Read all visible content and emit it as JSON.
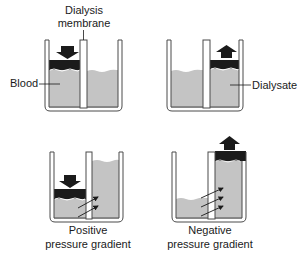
{
  "diagram": {
    "type": "dialysis-pressure-gradient-illustration",
    "colors": {
      "fluid": "#c4c4c4",
      "piston": "#1b1b1b",
      "outline": "#4a4a4a",
      "arrow": "#1b1b1b",
      "text": "#1a1a1a",
      "background": "#ffffff"
    },
    "labels": {
      "membrane_line1": "Dialysis",
      "membrane_line2": "membrane",
      "blood": "Blood",
      "dialysate": "Dialysate",
      "positive_line1": "Positive",
      "positive_line2": "pressure gradient",
      "negative_line1": "Negative",
      "negative_line2": "pressure gradient"
    },
    "panels": [
      {
        "id": "top-left",
        "piston_side": "left",
        "piston_direction": "down",
        "flow_arrows": 0
      },
      {
        "id": "top-right",
        "piston_side": "right",
        "piston_direction": "up",
        "flow_arrows": 0
      },
      {
        "id": "bottom-left",
        "piston_side": "left",
        "piston_direction": "down",
        "flow_arrows": 2,
        "caption": "Positive pressure gradient"
      },
      {
        "id": "bottom-right",
        "piston_side": "right",
        "piston_direction": "up",
        "flow_arrows": 3,
        "caption": "Negative pressure gradient"
      }
    ]
  }
}
